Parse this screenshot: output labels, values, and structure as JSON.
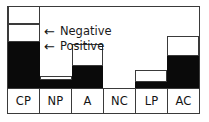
{
  "chart_data": {
    "type": "bar",
    "title": "",
    "xlabel": "",
    "ylabel": "",
    "stacked": true,
    "grid": false,
    "legend_position": "inline-annotation",
    "categories": [
      "CP",
      "NP",
      "A",
      "NC",
      "LP",
      "AC"
    ],
    "series": [
      {
        "name": "Positive",
        "color": "#0a0a0a",
        "values": [
          46,
          8,
          22,
          0,
          6,
          32
        ]
      },
      {
        "name": "Negative",
        "color": "#ffffff",
        "values": [
          18,
          4,
          22,
          0,
          12,
          20
        ]
      }
    ],
    "extra_segments": [
      {
        "category": "CP",
        "name": "upper-open-box",
        "height": 18,
        "color": "#ffffff"
      }
    ],
    "ylim": [
      0,
      82
    ]
  },
  "bars": [
    {
      "category": "CP",
      "segments": [
        {
          "role": "extra",
          "bottom": 64,
          "height": 18
        },
        {
          "role": "negative",
          "bottom": 46,
          "height": 18
        },
        {
          "role": "positive",
          "bottom": 0,
          "height": 46
        }
      ]
    },
    {
      "category": "NP",
      "segments": [
        {
          "role": "negative",
          "bottom": 8,
          "height": 4
        },
        {
          "role": "positive",
          "bottom": 0,
          "height": 8
        }
      ]
    },
    {
      "category": "A",
      "segments": [
        {
          "role": "negative",
          "bottom": 22,
          "height": 22
        },
        {
          "role": "positive",
          "bottom": 0,
          "height": 22
        }
      ]
    },
    {
      "category": "NC",
      "segments": []
    },
    {
      "category": "LP",
      "segments": [
        {
          "role": "negative",
          "bottom": 6,
          "height": 12
        },
        {
          "role": "positive",
          "bottom": 0,
          "height": 6
        }
      ]
    },
    {
      "category": "AC",
      "segments": [
        {
          "role": "negative",
          "bottom": 32,
          "height": 20
        },
        {
          "role": "positive",
          "bottom": 0,
          "height": 32
        }
      ]
    }
  ],
  "annotations": {
    "negative": {
      "arrow": "←",
      "label": "Negative"
    },
    "positive": {
      "arrow": "←",
      "label": "Positive"
    }
  },
  "axis_labels": {
    "cp": "CP",
    "np": "NP",
    "a": "A",
    "nc": "NC",
    "lp": "LP",
    "ac": "AC"
  },
  "colors": {
    "positive": "#0a0a0a",
    "negative": "#ffffff",
    "outline": "#3a3a3a",
    "background": "#ffffff"
  }
}
